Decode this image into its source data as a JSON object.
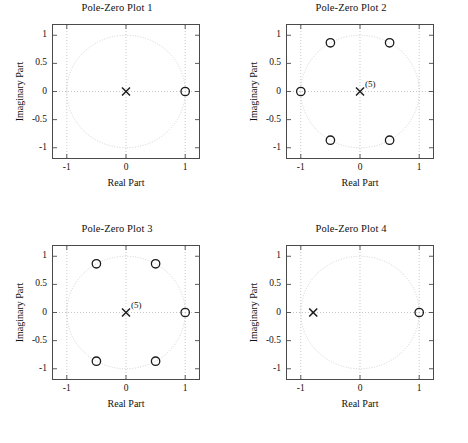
{
  "figure": {
    "width": 468,
    "height": 443,
    "background": "#ffffff",
    "foreground": "#1a1a1a",
    "grid_color": "#b9b9b9",
    "unit_circle_color": "#cccccc"
  },
  "chart_data": [
    {
      "type": "scatter",
      "title": "Pole-Zero Plot 1",
      "xlabel": "Real Part",
      "ylabel": "Imaginary Part",
      "xlim": [
        -1.25,
        1.25
      ],
      "ylim": [
        -1.2,
        1.2
      ],
      "xticks": [
        -1,
        0,
        1
      ],
      "xticklabels": [
        "-1",
        "0",
        "1"
      ],
      "yticks": [
        -1,
        -0.5,
        0,
        0.5,
        1
      ],
      "yticklabels": [
        "-1",
        "-0.5",
        "0",
        "0.5",
        "1"
      ],
      "grid": true,
      "unit_circle": true,
      "legend": "none",
      "series": [
        {
          "name": "zeros",
          "marker": "o",
          "points": [
            {
              "re": 1.0,
              "im": 0.0,
              "multiplicity": 1
            }
          ]
        },
        {
          "name": "poles",
          "marker": "x",
          "points": [
            {
              "re": 0.0,
              "im": 0.0,
              "multiplicity": 1
            }
          ]
        }
      ]
    },
    {
      "type": "scatter",
      "title": "Pole-Zero Plot 2",
      "xlabel": "Real Part",
      "ylabel": "Imaginary Part",
      "xlim": [
        -1.25,
        1.25
      ],
      "ylim": [
        -1.2,
        1.2
      ],
      "xticks": [
        -1,
        0,
        1
      ],
      "xticklabels": [
        "-1",
        "0",
        "1"
      ],
      "yticks": [
        -1,
        -0.5,
        0,
        0.5,
        1
      ],
      "yticklabels": [
        "-1",
        "-0.5",
        "0",
        "0.5",
        "1"
      ],
      "grid": true,
      "unit_circle": true,
      "legend": "none",
      "series": [
        {
          "name": "zeros",
          "marker": "o",
          "points": [
            {
              "re": -1.0,
              "im": 0.0,
              "multiplicity": 1
            },
            {
              "re": -0.5,
              "im": 0.866,
              "multiplicity": 1
            },
            {
              "re": 0.5,
              "im": 0.866,
              "multiplicity": 1
            },
            {
              "re": -0.5,
              "im": -0.866,
              "multiplicity": 1
            },
            {
              "re": 0.5,
              "im": -0.866,
              "multiplicity": 1
            }
          ]
        },
        {
          "name": "poles",
          "marker": "x",
          "points": [
            {
              "re": 0.0,
              "im": 0.0,
              "multiplicity": 5,
              "label": "(5)"
            }
          ]
        }
      ]
    },
    {
      "type": "scatter",
      "title": "Pole-Zero Plot 3",
      "xlabel": "Real Part",
      "ylabel": "Imaginary Part",
      "xlim": [
        -1.25,
        1.25
      ],
      "ylim": [
        -1.2,
        1.2
      ],
      "xticks": [
        -1,
        0,
        1
      ],
      "xticklabels": [
        "-1",
        "0",
        "1"
      ],
      "yticks": [
        -1,
        -0.5,
        0,
        0.5,
        1
      ],
      "yticklabels": [
        "-1",
        "-0.5",
        "0",
        "0.5",
        "1"
      ],
      "grid": true,
      "unit_circle": true,
      "legend": "none",
      "series": [
        {
          "name": "zeros",
          "marker": "o",
          "points": [
            {
              "re": 1.0,
              "im": 0.0,
              "multiplicity": 1
            },
            {
              "re": 0.5,
              "im": 0.866,
              "multiplicity": 1
            },
            {
              "re": -0.5,
              "im": 0.866,
              "multiplicity": 1
            },
            {
              "re": -0.5,
              "im": -0.866,
              "multiplicity": 1
            },
            {
              "re": 0.5,
              "im": -0.866,
              "multiplicity": 1
            }
          ]
        },
        {
          "name": "poles",
          "marker": "x",
          "points": [
            {
              "re": 0.0,
              "im": 0.0,
              "multiplicity": 5,
              "label": "(5)"
            }
          ]
        }
      ]
    },
    {
      "type": "scatter",
      "title": "Pole-Zero Plot 4",
      "xlabel": "Real Part",
      "ylabel": "Imaginary Part",
      "xlim": [
        -1.25,
        1.25
      ],
      "ylim": [
        -1.2,
        1.2
      ],
      "xticks": [
        -1,
        0,
        1
      ],
      "xticklabels": [
        "-1",
        "0",
        "1"
      ],
      "yticks": [
        -1,
        -0.5,
        0,
        0.5,
        1
      ],
      "yticklabels": [
        "-1",
        "-0.5",
        "0",
        "0.5",
        "1"
      ],
      "grid": true,
      "unit_circle": true,
      "legend": "none",
      "series": [
        {
          "name": "zeros",
          "marker": "o",
          "points": [
            {
              "re": 1.0,
              "im": 0.0,
              "multiplicity": 1
            }
          ]
        },
        {
          "name": "poles",
          "marker": "x",
          "points": [
            {
              "re": -0.79,
              "im": 0.0,
              "multiplicity": 1
            }
          ]
        }
      ]
    }
  ]
}
